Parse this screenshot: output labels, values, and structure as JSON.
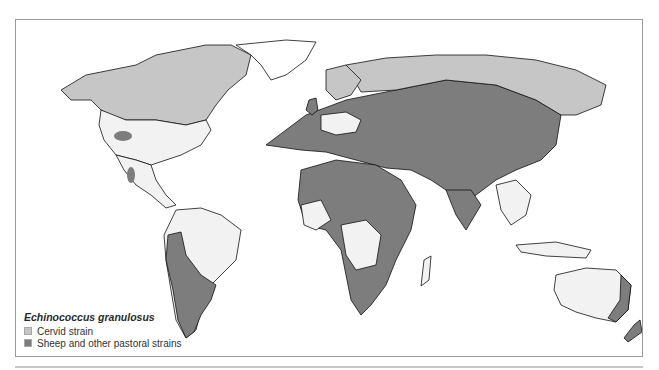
{
  "map": {
    "title": "Echinococcus granulosus distribution",
    "colors": {
      "cervid": "#c6c6c6",
      "sheep": "#7d7d7d",
      "land_unaffected": "#f2f2f2",
      "ocean": "#ffffff",
      "coast": "#111111",
      "border": "#9a9a9a"
    },
    "regions": [
      {
        "name": "Canada / Alaska",
        "strain": "cervid"
      },
      {
        "name": "Northern Russia / Siberia",
        "strain": "cervid"
      },
      {
        "name": "Scandinavia",
        "strain": "cervid"
      },
      {
        "name": "Western USA focus",
        "strain": "sheep"
      },
      {
        "name": "Mexico focus",
        "strain": "sheep"
      },
      {
        "name": "Western & southern South America",
        "strain": "sheep"
      },
      {
        "name": "Europe, Middle East, Central Asia, China",
        "strain": "sheep"
      },
      {
        "name": "North, East & Southern Africa",
        "strain": "sheep"
      },
      {
        "name": "South Asia",
        "strain": "sheep"
      },
      {
        "name": "Eastern Australia",
        "strain": "sheep"
      },
      {
        "name": "New Zealand",
        "strain": "sheep"
      }
    ]
  },
  "legend": {
    "title": "Echinococcus granulosus",
    "items": [
      {
        "label": "Cervid strain",
        "color": "#c6c6c6"
      },
      {
        "label": "Sheep and other pastoral strains",
        "color": "#7d7d7d"
      }
    ]
  }
}
